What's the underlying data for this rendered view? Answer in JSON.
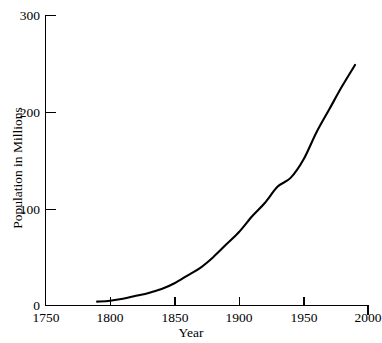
{
  "chart_data": {
    "type": "line",
    "title": "",
    "xlabel": "Year",
    "ylabel": "Population in Millions",
    "xlim": [
      1750,
      2000
    ],
    "ylim": [
      0,
      300
    ],
    "grid": false,
    "legend": "none",
    "line_color": "#000000",
    "background_color": "#ffffff",
    "xticks": [
      1750,
      1800,
      1850,
      1900,
      1950,
      2000
    ],
    "xtick_labels": [
      "1750",
      "1800",
      "1850",
      "1900",
      "1950",
      "2000"
    ],
    "yticks": [
      0,
      100,
      200,
      300
    ],
    "ytick_labels": [
      "0",
      "100",
      "200",
      "300"
    ],
    "x": [
      1790,
      1800,
      1810,
      1820,
      1830,
      1840,
      1850,
      1860,
      1870,
      1880,
      1890,
      1900,
      1910,
      1920,
      1930,
      1940,
      1950,
      1960,
      1970,
      1980,
      1990
    ],
    "values": [
      4,
      5,
      7,
      10,
      13,
      17,
      23,
      31,
      39,
      50,
      63,
      76,
      92,
      106,
      123,
      132,
      151,
      179,
      203,
      227,
      249
    ],
    "series": [
      {
        "name": "Population",
        "values": [
          4,
          5,
          7,
          10,
          13,
          17,
          23,
          31,
          39,
          50,
          63,
          76,
          92,
          106,
          123,
          132,
          151,
          179,
          203,
          227,
          249
        ]
      }
    ],
    "annotations": []
  }
}
